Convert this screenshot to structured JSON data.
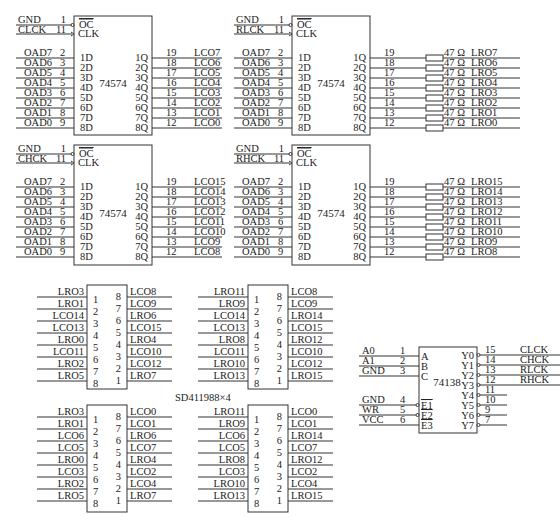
{
  "diagram": {
    "caption": "SD411988×4",
    "latches": [
      {
        "part": "74574",
        "box": {
          "x": 74,
          "y": 16,
          "w": 78,
          "h": 119
        },
        "oc_net": "GND",
        "oc_pin": "1",
        "clk_net": "CLCK",
        "clk_pin": "11",
        "inputs": [
          {
            "net": "OAD7",
            "pin": "2",
            "name": "1D"
          },
          {
            "net": "OAD6",
            "pin": "3",
            "name": "2D"
          },
          {
            "net": "OAD5",
            "pin": "4",
            "name": "3D"
          },
          {
            "net": "OAD4",
            "pin": "5",
            "name": "4D"
          },
          {
            "net": "OAD3",
            "pin": "6",
            "name": "5D"
          },
          {
            "net": "OAD2",
            "pin": "7",
            "name": "6D"
          },
          {
            "net": "OAD1",
            "pin": "8",
            "name": "7D"
          },
          {
            "net": "OAD0",
            "pin": "9",
            "name": "8D"
          }
        ],
        "outputs": [
          {
            "name": "1Q",
            "pin": "19",
            "net": "LCO7"
          },
          {
            "name": "2Q",
            "pin": "18",
            "net": "LCO6"
          },
          {
            "name": "3Q",
            "pin": "17",
            "net": "LCO5"
          },
          {
            "name": "4Q",
            "pin": "16",
            "net": "LCO4"
          },
          {
            "name": "5Q",
            "pin": "15",
            "net": "LCO3"
          },
          {
            "name": "6Q",
            "pin": "14",
            "net": "LCO2"
          },
          {
            "name": "7Q",
            "pin": "13",
            "net": "LCO1"
          },
          {
            "name": "8Q",
            "pin": "12",
            "net": "LCO0"
          }
        ],
        "resistor": ""
      },
      {
        "part": "74574",
        "box": {
          "x": 292,
          "y": 16,
          "w": 78,
          "h": 119
        },
        "oc_net": "GND",
        "oc_pin": "1",
        "clk_net": "RLCK",
        "clk_pin": "11",
        "inputs": [
          {
            "net": "OAD7",
            "pin": "2",
            "name": "1D"
          },
          {
            "net": "OAD6",
            "pin": "3",
            "name": "2D"
          },
          {
            "net": "OAD5",
            "pin": "4",
            "name": "3D"
          },
          {
            "net": "OAD4",
            "pin": "5",
            "name": "4D"
          },
          {
            "net": "OAD3",
            "pin": "6",
            "name": "5D"
          },
          {
            "net": "OAD2",
            "pin": "7",
            "name": "6D"
          },
          {
            "net": "OAD1",
            "pin": "8",
            "name": "7D"
          },
          {
            "net": "OAD0",
            "pin": "9",
            "name": "8D"
          }
        ],
        "outputs": [
          {
            "name": "1Q",
            "pin": "19",
            "net": "LRO7"
          },
          {
            "name": "2Q",
            "pin": "18",
            "net": "LRO6"
          },
          {
            "name": "3Q",
            "pin": "17",
            "net": "LRO5"
          },
          {
            "name": "4Q",
            "pin": "16",
            "net": "LRO4"
          },
          {
            "name": "5Q",
            "pin": "15",
            "net": "LRO3"
          },
          {
            "name": "6Q",
            "pin": "14",
            "net": "LRO2"
          },
          {
            "name": "7Q",
            "pin": "13",
            "net": "LRO1"
          },
          {
            "name": "8Q",
            "pin": "12",
            "net": "LRO0"
          }
        ],
        "resistor": "47 Ω"
      },
      {
        "part": "74574",
        "box": {
          "x": 74,
          "y": 145,
          "w": 78,
          "h": 120
        },
        "oc_net": "GND",
        "oc_pin": "1",
        "clk_net": "CHCK",
        "clk_pin": "11",
        "inputs": [
          {
            "net": "OAD7",
            "pin": "2",
            "name": "1D"
          },
          {
            "net": "OAD6",
            "pin": "3",
            "name": "2D"
          },
          {
            "net": "OAD5",
            "pin": "4",
            "name": "3D"
          },
          {
            "net": "OAD4",
            "pin": "5",
            "name": "4D"
          },
          {
            "net": "OAD3",
            "pin": "6",
            "name": "5D"
          },
          {
            "net": "OAD2",
            "pin": "7",
            "name": "6D"
          },
          {
            "net": "OAD1",
            "pin": "8",
            "name": "7D"
          },
          {
            "net": "OAD0",
            "pin": "9",
            "name": "8D"
          }
        ],
        "outputs": [
          {
            "name": "1Q",
            "pin": "19",
            "net": "LCO15"
          },
          {
            "name": "2Q",
            "pin": "18",
            "net": "LCO14"
          },
          {
            "name": "3Q",
            "pin": "17",
            "net": "LCO13"
          },
          {
            "name": "4Q",
            "pin": "16",
            "net": "LCO12"
          },
          {
            "name": "5Q",
            "pin": "15",
            "net": "LCO11"
          },
          {
            "name": "6Q",
            "pin": "14",
            "net": "LCO10"
          },
          {
            "name": "7Q",
            "pin": "13",
            "net": "LCO9"
          },
          {
            "name": "8Q",
            "pin": "12",
            "net": "LCO8"
          }
        ],
        "resistor": ""
      },
      {
        "part": "74574",
        "box": {
          "x": 292,
          "y": 145,
          "w": 78,
          "h": 120
        },
        "oc_net": "GND",
        "oc_pin": "1",
        "clk_net": "RHCK",
        "clk_pin": "11",
        "inputs": [
          {
            "net": "OAD7",
            "pin": "2",
            "name": "1D"
          },
          {
            "net": "OAD6",
            "pin": "3",
            "name": "2D"
          },
          {
            "net": "OAD5",
            "pin": "4",
            "name": "3D"
          },
          {
            "net": "OAD4",
            "pin": "5",
            "name": "4D"
          },
          {
            "net": "OAD3",
            "pin": "6",
            "name": "5D"
          },
          {
            "net": "OAD2",
            "pin": "7",
            "name": "6D"
          },
          {
            "net": "OAD1",
            "pin": "8",
            "name": "7D"
          },
          {
            "net": "OAD0",
            "pin": "9",
            "name": "8D"
          }
        ],
        "outputs": [
          {
            "name": "1Q",
            "pin": "19",
            "net": "LRO15"
          },
          {
            "name": "2Q",
            "pin": "18",
            "net": "LRO14"
          },
          {
            "name": "3Q",
            "pin": "17",
            "net": "LRO13"
          },
          {
            "name": "4Q",
            "pin": "16",
            "net": "LRO12"
          },
          {
            "name": "5Q",
            "pin": "15",
            "net": "LRO11"
          },
          {
            "name": "6Q",
            "pin": "14",
            "net": "LRO10"
          },
          {
            "name": "7Q",
            "pin": "13",
            "net": "LRO9"
          },
          {
            "name": "8Q",
            "pin": "12",
            "net": "LRO8"
          }
        ],
        "resistor": "47 Ω"
      }
    ],
    "displays": [
      {
        "box": {
          "x": 87,
          "y": 285,
          "w": 40,
          "h": 104
        },
        "left": [
          {
            "net": "LRO3",
            "pin": "1"
          },
          {
            "net": "LRO1",
            "pin": "2"
          },
          {
            "net": "LCO14",
            "pin": "3"
          },
          {
            "net": "LCO13",
            "pin": "4"
          },
          {
            "net": "LRO0",
            "pin": "5"
          },
          {
            "net": "LCO11",
            "pin": "6"
          },
          {
            "net": "LRO2",
            "pin": "7"
          },
          {
            "net": "LRO5",
            "pin": "8"
          }
        ],
        "right": [
          {
            "net": "LCO8",
            "pin": "8"
          },
          {
            "net": "LCO9",
            "pin": "7"
          },
          {
            "net": "LRO6",
            "pin": "6"
          },
          {
            "net": "LCO15",
            "pin": "5"
          },
          {
            "net": "LRO4",
            "pin": "4"
          },
          {
            "net": "LCO10",
            "pin": "3"
          },
          {
            "net": "LCO12",
            "pin": "2"
          },
          {
            "net": "LRO7",
            "pin": "1"
          }
        ]
      },
      {
        "box": {
          "x": 248,
          "y": 285,
          "w": 40,
          "h": 104
        },
        "left": [
          {
            "net": "LRO11",
            "pin": "1"
          },
          {
            "net": "LRO9",
            "pin": "2"
          },
          {
            "net": "LCO14",
            "pin": "3"
          },
          {
            "net": "LCO13",
            "pin": "4"
          },
          {
            "net": "LRO8",
            "pin": "5"
          },
          {
            "net": "LCO11",
            "pin": "6"
          },
          {
            "net": "LRO10",
            "pin": "7"
          },
          {
            "net": "LRO13",
            "pin": "8"
          }
        ],
        "right": [
          {
            "net": "LCO8",
            "pin": "8"
          },
          {
            "net": "LCO9",
            "pin": "7"
          },
          {
            "net": "LRO14",
            "pin": "6"
          },
          {
            "net": "LCO15",
            "pin": "5"
          },
          {
            "net": "LRO12",
            "pin": "4"
          },
          {
            "net": "LCO10",
            "pin": "3"
          },
          {
            "net": "LCO12",
            "pin": "2"
          },
          {
            "net": "LRO15",
            "pin": "1"
          }
        ]
      },
      {
        "box": {
          "x": 87,
          "y": 405,
          "w": 40,
          "h": 107
        },
        "left": [
          {
            "net": "LRO3",
            "pin": "1"
          },
          {
            "net": "LRO1",
            "pin": "2"
          },
          {
            "net": "LCO6",
            "pin": "3"
          },
          {
            "net": "LCO5",
            "pin": "4"
          },
          {
            "net": "LRO0",
            "pin": "5"
          },
          {
            "net": "LCO3",
            "pin": "6"
          },
          {
            "net": "LRO2",
            "pin": "7"
          },
          {
            "net": "LRO5",
            "pin": "8"
          }
        ],
        "right": [
          {
            "net": "LCO0",
            "pin": "8"
          },
          {
            "net": "LCO1",
            "pin": "7"
          },
          {
            "net": "LRO6",
            "pin": "6"
          },
          {
            "net": "LCO7",
            "pin": "5"
          },
          {
            "net": "LRO4",
            "pin": "4"
          },
          {
            "net": "LCO2",
            "pin": "3"
          },
          {
            "net": "LCO4",
            "pin": "2"
          },
          {
            "net": "LRO7",
            "pin": "1"
          }
        ]
      },
      {
        "box": {
          "x": 248,
          "y": 405,
          "w": 40,
          "h": 107
        },
        "left": [
          {
            "net": "LRO11",
            "pin": "1"
          },
          {
            "net": "LRO9",
            "pin": "2"
          },
          {
            "net": "LCO6",
            "pin": "3"
          },
          {
            "net": "LCO5",
            "pin": "4"
          },
          {
            "net": "LRO8",
            "pin": "5"
          },
          {
            "net": "LCO3",
            "pin": "6"
          },
          {
            "net": "LRO10",
            "pin": "7"
          },
          {
            "net": "LRO13",
            "pin": "8"
          }
        ],
        "right": [
          {
            "net": "LCO0",
            "pin": "8"
          },
          {
            "net": "LCO1",
            "pin": "7"
          },
          {
            "net": "LRO14",
            "pin": "6"
          },
          {
            "net": "LCO7",
            "pin": "5"
          },
          {
            "net": "LRO12",
            "pin": "4"
          },
          {
            "net": "LCO2",
            "pin": "3"
          },
          {
            "net": "LCO4",
            "pin": "2"
          },
          {
            "net": "LRO15",
            "pin": "1"
          }
        ]
      }
    ],
    "decoder": {
      "part": "74138",
      "box": {
        "x": 419,
        "y": 347,
        "w": 58,
        "h": 86
      },
      "inputs": [
        {
          "net": "A0",
          "pin": "1",
          "name": "A",
          "y": 356,
          "bubble": false
        },
        {
          "net": "A1",
          "pin": "2",
          "name": "B",
          "y": 366,
          "bubble": false
        },
        {
          "net": "GND",
          "pin": "3",
          "name": "C",
          "y": 376,
          "bubble": false
        },
        {
          "net": "GND",
          "pin": "4",
          "name": "E1",
          "y": 405,
          "bubble": true
        },
        {
          "net": "WR",
          "pin": "5",
          "name": "E2",
          "y": 415,
          "bubble": true
        },
        {
          "net": "VCC",
          "pin": "6",
          "name": "E3",
          "y": 425,
          "bubble": false
        }
      ],
      "outputs": [
        {
          "name": "Y0",
          "pin": "15",
          "net": "CLCK"
        },
        {
          "name": "Y1",
          "pin": "14",
          "net": "CHCK"
        },
        {
          "name": "Y2",
          "pin": "13",
          "net": "RLCK"
        },
        {
          "name": "Y3",
          "pin": "12",
          "net": "RHCK"
        },
        {
          "name": "Y4",
          "pin": "11",
          "net": ""
        },
        {
          "name": "Y5",
          "pin": "10",
          "net": ""
        },
        {
          "name": "Y6",
          "pin": "9",
          "net": ""
        },
        {
          "name": "Y7",
          "pin": "7",
          "net": ""
        }
      ]
    },
    "colors": {
      "ink": "#333333",
      "background": "#ffffff"
    }
  }
}
